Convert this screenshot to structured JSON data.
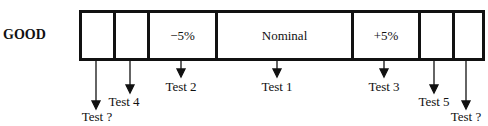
{
  "diagram": {
    "row_label": "GOOD",
    "segments": [
      {
        "label": ""
      },
      {
        "label": ""
      },
      {
        "label": "−5%"
      },
      {
        "label": "Nominal"
      },
      {
        "label": "+5%"
      },
      {
        "label": ""
      },
      {
        "label": ""
      }
    ],
    "tests": [
      {
        "label": "Test ?"
      },
      {
        "label": "Test 4"
      },
      {
        "label": "Test 2"
      },
      {
        "label": "Test 1"
      },
      {
        "label": "Test 3"
      },
      {
        "label": "Test 5"
      },
      {
        "label": "Test ?"
      }
    ],
    "line_color": "#111111"
  }
}
